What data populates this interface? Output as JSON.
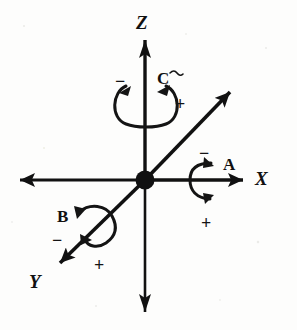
{
  "figure": {
    "type": "3d-cartesian-axes-rotation-diagram",
    "background_color": "#fdfdfc",
    "ink_color": "#111111",
    "origin": {
      "x": 145,
      "y": 180,
      "marker": "filled-dot"
    },
    "axes": [
      {
        "name": "X",
        "label": "X",
        "label_x": 255,
        "label_y": 169,
        "orientation": "horizontal",
        "positive_direction": "right",
        "arrowheads": "both-ends",
        "start": {
          "x": 18,
          "y": 180
        },
        "end": {
          "x": 243,
          "y": 180
        }
      },
      {
        "name": "Y",
        "label": "Y",
        "label_x": 29,
        "label_y": 272,
        "orientation": "diagonal",
        "positive_direction": "lower-left",
        "arrowheads": "both-ends",
        "start": {
          "x": 233,
          "y": 90
        },
        "end": {
          "x": 57,
          "y": 265
        }
      },
      {
        "name": "Z",
        "label": "Z",
        "label_x": 136,
        "label_y": 13,
        "orientation": "vertical",
        "positive_direction": "up",
        "arrowheads": "both-ends",
        "start": {
          "x": 145,
          "y": 37
        },
        "end": {
          "x": 145,
          "y": 315
        }
      }
    ],
    "rotations": [
      {
        "id": "A",
        "label": "A",
        "about_axis": "X",
        "label_x": 223,
        "label_y": 156,
        "minus_sign": "−",
        "minus_x": 199,
        "minus_y": 144,
        "plus_sign": "+",
        "plus_x": 201,
        "plus_y": 214,
        "arc_shape": "c-open-right",
        "arrowheads": 2
      },
      {
        "id": "B",
        "label": "B",
        "about_axis": "Y",
        "label_x": 57,
        "label_y": 208,
        "minus_sign": "−",
        "minus_x": 52,
        "minus_y": 231,
        "plus_sign": "+",
        "plus_x": 94,
        "plus_y": 256,
        "arc_shape": "loop-around-diagonal",
        "arrowheads": 2
      },
      {
        "id": "C",
        "label": "C",
        "about_axis": "Z",
        "label_x": 157,
        "label_y": 70,
        "minus_sign": "−",
        "minus_x": 115,
        "minus_y": 72,
        "plus_sign": "+",
        "plus_x": 175,
        "plus_y": 95,
        "arc_shape": "ellipse-open-top",
        "arrowheads": 2
      }
    ]
  }
}
